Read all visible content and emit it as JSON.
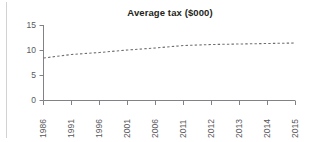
{
  "chart_data": {
    "type": "line",
    "title": "Average tax ($000)",
    "xlabel": "",
    "ylabel": "",
    "categories": [
      "1986",
      "1991",
      "1996",
      "2001",
      "2006",
      "2011",
      "2012",
      "2013",
      "2014",
      "2015"
    ],
    "series": [
      {
        "name": "Average tax",
        "style": "dashed",
        "color": "#6d6e71",
        "values": [
          8.5,
          9.2,
          9.6,
          10.1,
          10.5,
          11.0,
          11.2,
          11.3,
          11.4,
          11.5
        ]
      }
    ],
    "ylim": [
      0,
      15
    ],
    "yticks": [
      0,
      5,
      10,
      15
    ],
    "ytick_labels": [
      "0",
      "5",
      "10",
      "15"
    ],
    "grid": false,
    "legend": "none",
    "xtick_rotation": -90
  },
  "axis": {
    "y_labels": [
      "15",
      "10",
      "5",
      "0"
    ],
    "x_labels": [
      "1986",
      "1991",
      "1996",
      "2001",
      "2006",
      "2011",
      "2012",
      "2013",
      "2014",
      "2015"
    ]
  },
  "colors": {
    "line": "#6d6e71",
    "axis": "#808285",
    "tick_text": "#58595b",
    "title_text": "#231f20",
    "left_rule": "#d2d2d2",
    "background": "#ffffff"
  }
}
